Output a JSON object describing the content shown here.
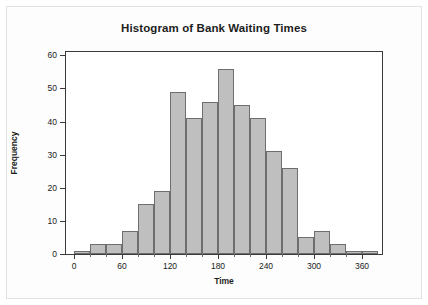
{
  "chart_data": {
    "type": "bar",
    "title": "Histogram of Bank Waiting Times",
    "xlabel": "Time",
    "ylabel": "Frequency",
    "xlim": [
      -10,
      385
    ],
    "ylim": [
      0,
      61
    ],
    "grid": false,
    "legend": null,
    "bin_width": 20,
    "bin_starts": [
      0,
      20,
      40,
      60,
      80,
      100,
      120,
      140,
      160,
      180,
      200,
      220,
      240,
      260,
      280,
      300,
      320,
      340,
      360
    ],
    "bin_ends": [
      20,
      40,
      60,
      80,
      100,
      120,
      140,
      160,
      180,
      200,
      220,
      240,
      260,
      280,
      300,
      320,
      340,
      360,
      380
    ],
    "categories": [
      "0-20",
      "20-40",
      "40-60",
      "60-80",
      "80-100",
      "100-120",
      "120-140",
      "140-160",
      "160-180",
      "180-200",
      "200-220",
      "220-240",
      "240-260",
      "260-280",
      "280-300",
      "300-320",
      "320-340",
      "340-360",
      "360-380"
    ],
    "values": [
      1,
      3,
      3,
      7,
      15,
      19,
      49,
      41,
      46,
      56,
      45,
      41,
      31,
      26,
      5,
      7,
      3,
      1,
      1
    ],
    "x_ticks": [
      0,
      60,
      120,
      180,
      240,
      300,
      360
    ],
    "x_tick_labels": [
      "0",
      "60",
      "120",
      "180",
      "240",
      "300",
      "360"
    ],
    "x_minor_ticks": [
      20,
      40,
      80,
      100,
      140,
      160,
      200,
      220,
      260,
      280,
      320,
      340
    ],
    "y_ticks": [
      0,
      10,
      20,
      30,
      40,
      50,
      60
    ],
    "y_tick_labels": [
      "0",
      "10",
      "20",
      "30",
      "40",
      "50",
      "60"
    ],
    "bar_fill_color": "#bfbfbf",
    "bar_edge_color": "#6e6e6e",
    "axis_color": "#3a3a3a",
    "background_color": "#ffffff"
  }
}
